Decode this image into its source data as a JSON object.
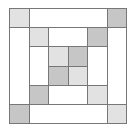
{
  "diagram": {
    "title": "",
    "type": "quilt-block",
    "grid_units": 6,
    "colors": {
      "light": "#e2e2e2",
      "dark": "#c6c6c6",
      "white": "#ffffff",
      "line": "#777777"
    },
    "pieces": [
      {
        "name": "corner-tl",
        "x": 0,
        "y": 0,
        "w": 1,
        "h": 1,
        "fill": "light"
      },
      {
        "name": "top-bar",
        "x": 1,
        "y": 0,
        "w": 4,
        "h": 1,
        "fill": "white"
      },
      {
        "name": "corner-tr",
        "x": 5,
        "y": 0,
        "w": 1,
        "h": 1,
        "fill": "dark"
      },
      {
        "name": "left-bar",
        "x": 0,
        "y": 1,
        "w": 1,
        "h": 4,
        "fill": "white"
      },
      {
        "name": "right-bar",
        "x": 5,
        "y": 1,
        "w": 1,
        "h": 4,
        "fill": "white"
      },
      {
        "name": "corner-bl",
        "x": 0,
        "y": 5,
        "w": 1,
        "h": 1,
        "fill": "dark"
      },
      {
        "name": "bottom-bar",
        "x": 1,
        "y": 5,
        "w": 4,
        "h": 1,
        "fill": "white"
      },
      {
        "name": "corner-br",
        "x": 5,
        "y": 5,
        "w": 1,
        "h": 1,
        "fill": "light"
      },
      {
        "name": "inner-corner-tl",
        "x": 1,
        "y": 1,
        "w": 1,
        "h": 1,
        "fill": "light"
      },
      {
        "name": "inner-top-bar",
        "x": 2,
        "y": 1,
        "w": 2,
        "h": 1,
        "fill": "white"
      },
      {
        "name": "inner-corner-tr",
        "x": 4,
        "y": 1,
        "w": 1,
        "h": 1,
        "fill": "dark"
      },
      {
        "name": "inner-left-bar",
        "x": 1,
        "y": 2,
        "w": 1,
        "h": 2,
        "fill": "white"
      },
      {
        "name": "inner-right-bar",
        "x": 4,
        "y": 2,
        "w": 1,
        "h": 2,
        "fill": "white"
      },
      {
        "name": "inner-corner-bl",
        "x": 1,
        "y": 4,
        "w": 1,
        "h": 1,
        "fill": "dark"
      },
      {
        "name": "inner-bottom-bar",
        "x": 2,
        "y": 4,
        "w": 2,
        "h": 1,
        "fill": "white"
      },
      {
        "name": "inner-corner-br",
        "x": 4,
        "y": 4,
        "w": 1,
        "h": 1,
        "fill": "light"
      },
      {
        "name": "center-tl",
        "x": 2,
        "y": 2,
        "w": 1,
        "h": 1,
        "fill": "light"
      },
      {
        "name": "center-tr",
        "x": 3,
        "y": 2,
        "w": 1,
        "h": 1,
        "fill": "dark"
      },
      {
        "name": "center-bl",
        "x": 2,
        "y": 3,
        "w": 1,
        "h": 1,
        "fill": "dark"
      },
      {
        "name": "center-br",
        "x": 3,
        "y": 3,
        "w": 1,
        "h": 1,
        "fill": "light"
      }
    ]
  }
}
